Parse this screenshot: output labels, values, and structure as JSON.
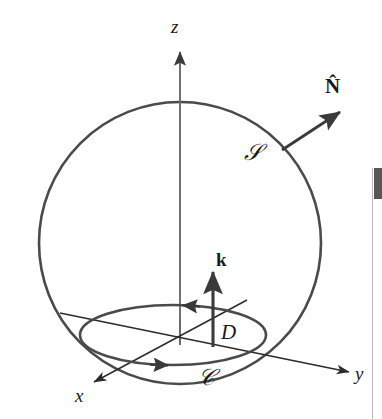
{
  "figure": {
    "background_color": "#ffffff",
    "stroke_color": "#4a4a4a",
    "label_color": "#1a1a1a",
    "axes": {
      "z_label": "z",
      "x_label": "x",
      "y_label": "y"
    },
    "annotations": {
      "normal_vector": "N̂",
      "surface": "𝒮",
      "k_vector": "k",
      "disk": "D",
      "curve": "𝒞"
    }
  },
  "scrollbar": {
    "name": "vertical-scrollbar",
    "thumb_color": "#575757",
    "track_color": "#ffffff"
  }
}
